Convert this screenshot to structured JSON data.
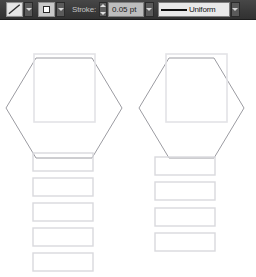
{
  "toolbar": {
    "stroke_swatch": {
      "icon": "stroke-color-swatch-diagonal",
      "title": "Stroke Color"
    },
    "stroke_swatch_arrow": {
      "icon": "chevron-down-icon"
    },
    "stroke_style_button": {
      "icon": "square-stroke-style-icon",
      "title": "Stroke Style"
    },
    "stroke_style_arrow": {
      "icon": "chevron-down-icon"
    },
    "stroke_label": "Stroke:",
    "stroke_spinner": {
      "up_icon": "caret-up-icon",
      "down_icon": "caret-down-icon"
    },
    "stroke_weight_value": "0.05 pt",
    "stroke_weight_placeholder": "0 pt",
    "stroke_weight_arrow": {
      "icon": "chevron-down-icon"
    },
    "profile_preview_icon": "uniform-stroke-profile-line",
    "profile_label": "Uniform",
    "profile_arrow": {
      "icon": "chevron-down-icon"
    },
    "colors": {
      "bar_background": "#3a3a3a",
      "text": "#c3c3c3",
      "field_background": "#bdbdbd",
      "combo_background": "#e9e9e9"
    }
  },
  "canvas": {
    "stroke_color": "#9c9ca2",
    "inner_stroke_color": "#e3e3e6",
    "list_stroke_color": "#d9d9dd",
    "shapes": {
      "hexagons": [
        {
          "name": "hexagon-left",
          "points": "6,88 36,38 92,38 122,88 92,138 36,138"
        },
        {
          "name": "hexagon-right",
          "points": "139,88 169,38 214,38 244,88 214,138 169,138"
        }
      ],
      "inner_squares": [
        {
          "name": "inner-square-left",
          "x": 34,
          "y": 34,
          "width": 61,
          "height": 68
        },
        {
          "name": "inner-square-right",
          "x": 166,
          "y": 34,
          "width": 61,
          "height": 68
        }
      ],
      "left_column_rects": [
        {
          "name": "list-rect-left-1",
          "x": 33,
          "y": 133,
          "width": 60,
          "height": 18
        },
        {
          "name": "list-rect-left-2",
          "x": 33,
          "y": 158,
          "width": 60,
          "height": 18
        },
        {
          "name": "list-rect-left-3",
          "x": 33,
          "y": 183,
          "width": 60,
          "height": 18
        },
        {
          "name": "list-rect-left-4",
          "x": 33,
          "y": 208,
          "width": 60,
          "height": 18
        },
        {
          "name": "list-rect-left-5",
          "x": 33,
          "y": 233,
          "width": 60,
          "height": 18
        }
      ],
      "right_column_rects": [
        {
          "name": "list-rect-right-1",
          "x": 155,
          "y": 137,
          "width": 60,
          "height": 18
        },
        {
          "name": "list-rect-right-2",
          "x": 155,
          "y": 162,
          "width": 60,
          "height": 18
        },
        {
          "name": "list-rect-right-3",
          "x": 155,
          "y": 188,
          "width": 60,
          "height": 18
        },
        {
          "name": "list-rect-right-4",
          "x": 155,
          "y": 213,
          "width": 60,
          "height": 18
        }
      ]
    }
  }
}
